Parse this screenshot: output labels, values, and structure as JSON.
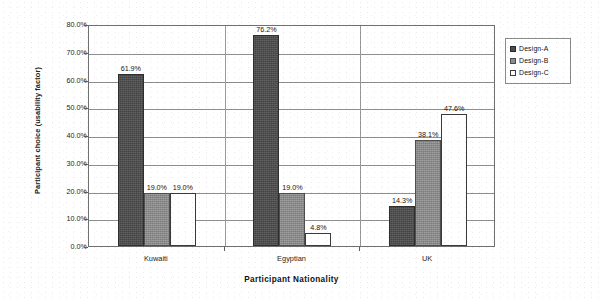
{
  "chart_data": {
    "type": "bar",
    "title": "",
    "subtitle": "",
    "xlabel": "Participant Nationality",
    "ylabel": "Participant choice (usability factor)",
    "categories": [
      "Kuwaiti",
      "Egyptian",
      "UK"
    ],
    "series": [
      {
        "name": "Design-A",
        "values": [
          61.9,
          76.2,
          14.3
        ],
        "color": "#4c4c4c"
      },
      {
        "name": "Design-B",
        "values": [
          19.0,
          19.0,
          38.1
        ],
        "color": "#8d8d8d"
      },
      {
        "name": "Design-C",
        "values": [
          19.0,
          4.8,
          47.6
        ],
        "color": "#ffffff"
      }
    ],
    "data_labels": [
      [
        "61.9%",
        "19.0%",
        "19.0%"
      ],
      [
        "76.2%",
        "19.0%",
        "4.8%"
      ],
      [
        "14.3%",
        "38.1%",
        "47.6%"
      ]
    ],
    "ylim": [
      0,
      80
    ],
    "ytick_values": [
      0,
      10,
      20,
      30,
      40,
      50,
      60,
      70,
      80
    ],
    "ytick_labels": [
      "0.0%",
      "10.0%",
      "20.0%",
      "30.0%",
      "40.0%",
      "50.0%",
      "60.0%",
      "70.0%",
      "80.0%"
    ],
    "grid": true,
    "grid_axis": "y",
    "legend_position": "right",
    "legend_entries": [
      "Design-A",
      "Design-B",
      "Design-C"
    ]
  },
  "legend": {
    "items": [
      {
        "label": "Design-A",
        "swatch": "legend-swatch-design-a"
      },
      {
        "label": "Design-B",
        "swatch": "legend-swatch-design-b"
      },
      {
        "label": "Design-C",
        "swatch": "legend-swatch-design-c"
      }
    ]
  },
  "axes": {
    "y_title": "Participant choice (usability factor)",
    "x_title": "Participant Nationality"
  }
}
